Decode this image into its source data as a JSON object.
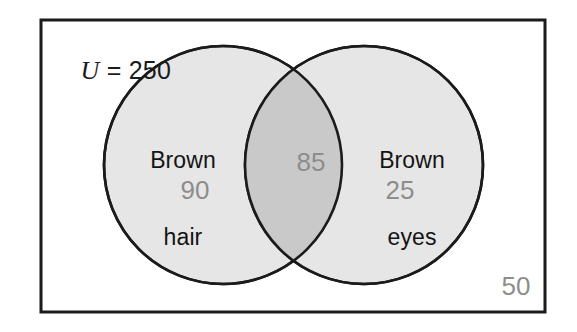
{
  "figure": {
    "type": "venn-diagram",
    "sets": 2,
    "universe": {
      "symbol": "U",
      "equals": " = ",
      "total": "250",
      "outside_count": "50"
    },
    "regions": [
      {
        "id": "left-only",
        "label": "Brown\nhair",
        "label_line1": "Brown",
        "label_line2": "hair",
        "count": "90"
      },
      {
        "id": "intersection",
        "label": "",
        "count": "85"
      },
      {
        "id": "right-only",
        "label": "Brown\neyes",
        "label_line1": "Brown",
        "label_line2": "eyes",
        "count": "25"
      }
    ],
    "colors": {
      "background": "#ffffff",
      "border": "#1b1b1b",
      "circle_fill": "#e6e6e6",
      "intersection_fill": "#c9c9c9",
      "circle_stroke": "#1b1b1b",
      "count_text": "#8d8d8d",
      "label_text": "#141414"
    }
  }
}
